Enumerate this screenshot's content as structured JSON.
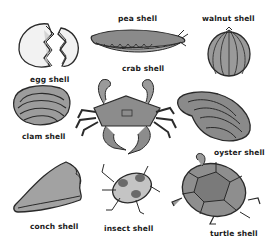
{
  "items": [
    {
      "id": "egg",
      "label": "egg shell"
    },
    {
      "id": "pea",
      "label": "pea shell"
    },
    {
      "id": "walnut",
      "label": "walnut shell"
    },
    {
      "id": "crab",
      "label": "crab shell"
    },
    {
      "id": "clam",
      "label": "clam shell"
    },
    {
      "id": "oyster",
      "label": "oyster shell"
    },
    {
      "id": "conch",
      "label": "conch shell"
    },
    {
      "id": "insect",
      "label": "insect shell"
    },
    {
      "id": "turtle",
      "label": "turtle shell"
    }
  ],
  "colors": {
    "background": "#ffffff",
    "outline": "#2a2a2a",
    "shell_fill": "#8f8f8f",
    "light_fill": "#cfcfcf",
    "text": "#1a1a1a"
  }
}
